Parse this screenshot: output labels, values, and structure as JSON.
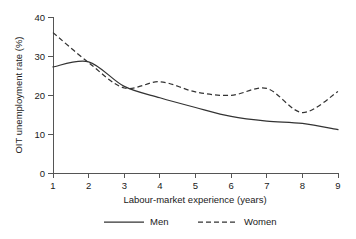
{
  "chart_data": {
    "type": "line",
    "title": "",
    "xlabel": "Labour-market experience (years)",
    "ylabel": "OIT unemployment rate (%)",
    "x": [
      1,
      2,
      3,
      4,
      5,
      6,
      7,
      8,
      9
    ],
    "xtick_labels": [
      "1",
      "2",
      "3",
      "4",
      "5",
      "6",
      "7",
      "8",
      "9"
    ],
    "ytick_labels": [
      "0",
      "10",
      "20",
      "30",
      "40"
    ],
    "yticks": [
      0,
      10,
      20,
      30,
      40
    ],
    "xlim": [
      1,
      9
    ],
    "ylim": [
      0,
      40
    ],
    "grid": false,
    "legend_position": "below-axes-center",
    "series": [
      {
        "name": "Men",
        "style": "solid",
        "color": "#333333",
        "values": [
          27.2,
          28.5,
          22.2,
          19.3,
          16.8,
          14.5,
          13.3,
          12.7,
          11.1
        ]
      },
      {
        "name": "Women",
        "style": "dashed",
        "color": "#333333",
        "values": [
          36.0,
          28.3,
          21.8,
          23.4,
          20.8,
          19.9,
          21.7,
          15.5,
          20.9
        ]
      }
    ]
  },
  "legend": {
    "entries": [
      {
        "label": "Men"
      },
      {
        "label": "Women"
      }
    ]
  }
}
